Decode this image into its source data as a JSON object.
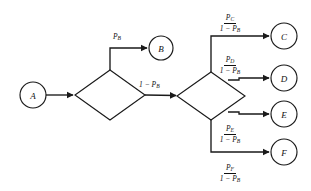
{
  "diagram": {
    "type": "probability-flowchart",
    "nodes": [
      {
        "id": "A",
        "label": "A",
        "shape": "circle",
        "cx": 33,
        "cy": 95,
        "r": 13
      },
      {
        "id": "B",
        "label": "B",
        "shape": "circle",
        "cx": 161,
        "cy": 48,
        "r": 12
      },
      {
        "id": "C",
        "label": "C",
        "shape": "circle",
        "cx": 284,
        "cy": 36,
        "r": 13
      },
      {
        "id": "D",
        "label": "D",
        "shape": "circle",
        "cx": 284,
        "cy": 78,
        "r": 13
      },
      {
        "id": "E",
        "label": "E",
        "shape": "circle",
        "cx": 284,
        "cy": 114,
        "r": 13
      },
      {
        "id": "F",
        "label": "F",
        "shape": "circle",
        "cx": 284,
        "cy": 152,
        "r": 13
      },
      {
        "id": "decision1",
        "label": "",
        "shape": "diamond",
        "cx": 110,
        "cy": 95,
        "rx": 35,
        "ry": 25
      },
      {
        "id": "decision2",
        "label": "",
        "shape": "diamond",
        "cx": 211,
        "cy": 96,
        "rx": 34,
        "ry": 24
      }
    ],
    "edge_labels": [
      {
        "id": "edge-b",
        "kind": "plain",
        "text": "P",
        "sub": "B",
        "target": "B"
      },
      {
        "id": "edge-nb",
        "kind": "plain",
        "text": "1 − P",
        "sub": "B",
        "target": "decision2"
      },
      {
        "id": "edge-c",
        "kind": "fraction",
        "numerator": "P",
        "numerator_sub": "C",
        "denominator": "1 − P",
        "denominator_sub": "B",
        "target": "C"
      },
      {
        "id": "edge-d",
        "kind": "fraction",
        "numerator": "P",
        "numerator_sub": "D",
        "denominator": "1 − P",
        "denominator_sub": "B",
        "target": "D"
      },
      {
        "id": "edge-e",
        "kind": "fraction",
        "numerator": "P",
        "numerator_sub": "E",
        "denominator": "1 − P",
        "denominator_sub": "B",
        "target": "E"
      },
      {
        "id": "edge-f",
        "kind": "fraction",
        "numerator": "P",
        "numerator_sub": "F",
        "denominator": "1 − P",
        "denominator_sub": "B",
        "target": "F"
      }
    ],
    "colors": {
      "stroke": "#1a1a1a",
      "fill": "#ffffff",
      "text": "#111111"
    }
  }
}
